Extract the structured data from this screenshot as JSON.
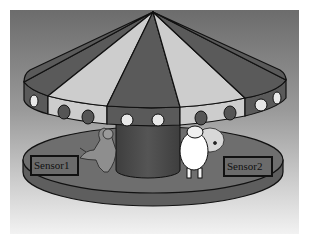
{
  "scene": {
    "subject": "carousel illustration",
    "palette": {
      "background_top": "#6f6f6f",
      "background_bottom": "#f0f0f0",
      "canopy_dark": "#5a5a5a",
      "canopy_light": "#cfcfcf",
      "outline": "#111111",
      "platform": "#666666",
      "pole": "#4a4a4a",
      "window_light": "#e8e8e8",
      "window_dark": "#555555"
    },
    "figures": [
      {
        "name": "kangaroo",
        "position": "left"
      },
      {
        "name": "polar-bear",
        "position": "center-right"
      },
      {
        "name": "sheep",
        "position": "right"
      }
    ]
  },
  "sensors": [
    {
      "label": "Sensor1"
    },
    {
      "label": "Sensor2"
    }
  ]
}
